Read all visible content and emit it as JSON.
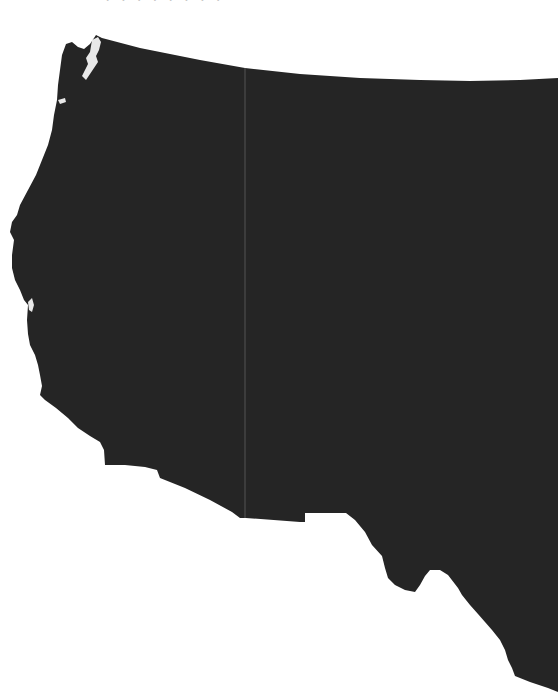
{
  "caption": {
    "text": "· · ·  · · · · ·",
    "note_visible": "truncated text at top edge, only lower pixels visible"
  },
  "map": {
    "region": "Western United States",
    "fill_color": "#252525",
    "background_color": "#ffffff",
    "coast_highlight_color": "#e8e8e8",
    "divider_color": "#6a6a6a",
    "divider_x": 245
  }
}
